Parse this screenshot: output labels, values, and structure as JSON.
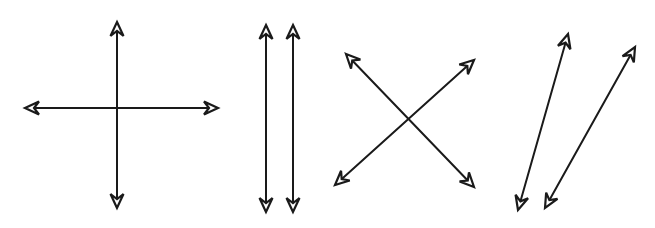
{
  "figure": {
    "background": "#ffffff",
    "stroke_color": "#1a1a1a",
    "groups": [
      {
        "name": "perpendicular-lines",
        "lines": [
          {
            "name": "vertical-line",
            "x1": 117,
            "y1": 22,
            "x2": 117,
            "y2": 208
          },
          {
            "name": "horizontal-line",
            "x1": 25,
            "y1": 108,
            "x2": 218,
            "y2": 108
          }
        ]
      },
      {
        "name": "parallel-vertical-lines",
        "lines": [
          {
            "name": "left-vertical-line",
            "x1": 266,
            "y1": 25,
            "x2": 266,
            "y2": 212
          },
          {
            "name": "right-vertical-line",
            "x1": 293,
            "y1": 25,
            "x2": 293,
            "y2": 212
          }
        ]
      },
      {
        "name": "intersecting-diagonal-lines",
        "lines": [
          {
            "name": "descending-diagonal-line",
            "x1": 346,
            "y1": 54,
            "x2": 474,
            "y2": 187
          },
          {
            "name": "ascending-diagonal-line",
            "x1": 474,
            "y1": 60,
            "x2": 335,
            "y2": 185
          }
        ]
      },
      {
        "name": "skew-lines",
        "lines": [
          {
            "name": "left-skew-line",
            "x1": 568,
            "y1": 34,
            "x2": 518,
            "y2": 210
          },
          {
            "name": "right-skew-line",
            "x1": 635,
            "y1": 47,
            "x2": 545,
            "y2": 208
          }
        ]
      }
    ]
  }
}
